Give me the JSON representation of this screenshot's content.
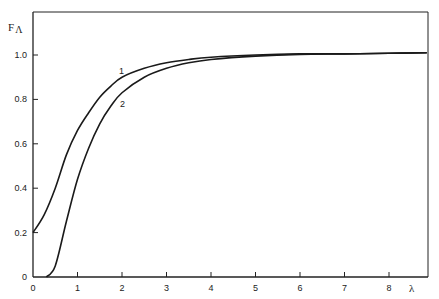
{
  "chart_data": {
    "type": "line",
    "title": "",
    "xlabel": "λ",
    "ylabel": "F_Λ",
    "xlim": [
      0,
      9
    ],
    "ylim": [
      0,
      1.15
    ],
    "x_ticks": [
      "0",
      "1",
      "2",
      "3",
      "4",
      "5",
      "6",
      "7",
      "8"
    ],
    "y_ticks": [
      "0",
      "0.2",
      "0.4",
      "0.6",
      "0.8",
      "1.0"
    ],
    "grid": false,
    "legend": "inline curve labels",
    "series": [
      {
        "name": "1",
        "x": [
          0,
          0.25,
          0.5,
          0.75,
          1.0,
          1.25,
          1.5,
          1.75,
          2.0,
          2.5,
          3.0,
          3.5,
          4.0,
          5.0,
          6.0,
          7.0,
          8.0,
          9.0
        ],
        "y": [
          0.2,
          0.28,
          0.4,
          0.55,
          0.66,
          0.74,
          0.81,
          0.86,
          0.9,
          0.94,
          0.965,
          0.98,
          0.99,
          1.0,
          1.005,
          1.005,
          1.008,
          1.01
        ]
      },
      {
        "name": "2",
        "x": [
          0.3,
          0.5,
          0.75,
          1.0,
          1.25,
          1.5,
          1.75,
          2.0,
          2.5,
          3.0,
          3.5,
          4.0,
          5.0,
          6.0,
          7.0,
          8.0,
          9.0
        ],
        "y": [
          0.0,
          0.05,
          0.25,
          0.44,
          0.58,
          0.69,
          0.77,
          0.83,
          0.9,
          0.94,
          0.965,
          0.98,
          0.995,
          1.003,
          1.005,
          1.008,
          1.01
        ]
      }
    ]
  },
  "labels": {
    "y_axis": "F",
    "y_axis_sub": "Λ",
    "x_axis": "λ",
    "curve1": "1",
    "curve2": "2"
  }
}
